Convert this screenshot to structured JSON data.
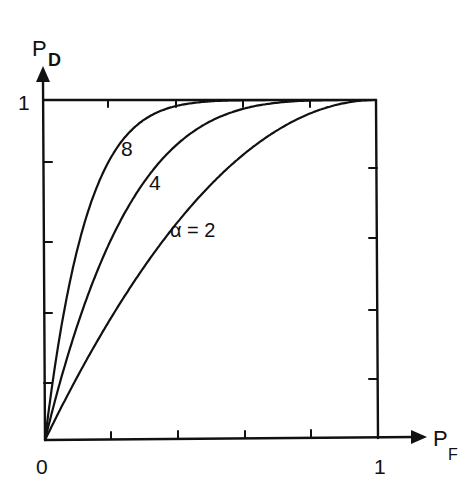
{
  "chart_data": {
    "type": "line",
    "title": "",
    "xlabel": "P_F",
    "ylabel": "P_D",
    "xlabel_main": "P",
    "xlabel_sub": "F",
    "ylabel_main": "P",
    "ylabel_sub": "D",
    "xlim": [
      0,
      1
    ],
    "ylim": [
      0,
      1
    ],
    "x_tick_labels": {
      "origin": "0",
      "end": "1"
    },
    "y_tick_labels": {
      "end": "1"
    },
    "minor_ticks": [
      0.2,
      0.4,
      0.6,
      0.8
    ],
    "grid": false,
    "legend": "inline curve labels",
    "x": [
      0,
      0.05,
      0.1,
      0.15,
      0.2,
      0.3,
      0.4,
      0.5,
      0.6,
      0.7,
      0.8,
      0.9,
      1.0
    ],
    "series": [
      {
        "name": "α = 2",
        "label": "α = 2",
        "alpha": 2,
        "values": [
          0,
          0.1,
          0.19,
          0.28,
          0.36,
          0.51,
          0.64,
          0.75,
          0.84,
          0.91,
          0.96,
          0.99,
          1.0
        ]
      },
      {
        "name": "4",
        "label": "4",
        "alpha": 4,
        "values": [
          0,
          0.19,
          0.34,
          0.48,
          0.59,
          0.76,
          0.87,
          0.94,
          0.97,
          0.99,
          1.0,
          1.0,
          1.0
        ]
      },
      {
        "name": "8",
        "label": "8",
        "alpha": 8,
        "values": [
          0,
          0.34,
          0.57,
          0.73,
          0.83,
          0.94,
          0.98,
          1.0,
          1.0,
          1.0,
          1.0,
          1.0,
          1.0
        ]
      }
    ]
  }
}
